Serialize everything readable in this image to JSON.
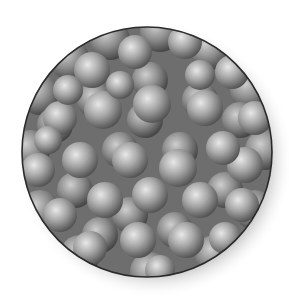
{
  "figure": {
    "circle": {
      "cx": 147,
      "cy": 152,
      "r": 125,
      "stroke": "#2a2a2a",
      "background": "#6e6e6e"
    },
    "colors": {
      "sphere_highlight": "#e6e6e6",
      "sphere_mid": "#a8a8a8",
      "sphere_shadow": "#4a4a4a",
      "shadow": "#bdbdbd"
    },
    "back_layer": [
      [
        40,
        95,
        20
      ],
      [
        70,
        60,
        20
      ],
      [
        110,
        40,
        20
      ],
      [
        160,
        32,
        20
      ],
      [
        210,
        50,
        20
      ],
      [
        250,
        90,
        20
      ],
      [
        30,
        150,
        20
      ],
      [
        265,
        150,
        20
      ],
      [
        40,
        210,
        20
      ],
      [
        255,
        210,
        20
      ],
      [
        80,
        255,
        20
      ],
      [
        150,
        272,
        20
      ],
      [
        215,
        255,
        20
      ],
      [
        95,
        100,
        18
      ],
      [
        150,
        80,
        18
      ],
      [
        200,
        100,
        18
      ],
      [
        120,
        150,
        18
      ],
      [
        180,
        150,
        18
      ],
      [
        75,
        190,
        18
      ],
      [
        225,
        190,
        18
      ],
      [
        130,
        215,
        18
      ],
      [
        175,
        230,
        18
      ],
      [
        100,
        235,
        18
      ],
      [
        240,
        120,
        18
      ],
      [
        55,
        125,
        18
      ],
      [
        145,
        120,
        18
      ]
    ],
    "front_layer": [
      [
        92,
        70,
        18
      ],
      [
        135,
        52,
        17
      ],
      [
        185,
        42,
        17
      ],
      [
        232,
        72,
        17
      ],
      [
        255,
        118,
        17
      ],
      [
        60,
        118,
        17
      ],
      [
        103,
        110,
        19
      ],
      [
        152,
        104,
        19
      ],
      [
        205,
        108,
        18
      ],
      [
        245,
        165,
        18
      ],
      [
        38,
        170,
        17
      ],
      [
        80,
        160,
        18
      ],
      [
        130,
        160,
        18
      ],
      [
        178,
        168,
        19
      ],
      [
        223,
        148,
        17
      ],
      [
        60,
        215,
        17
      ],
      [
        105,
        200,
        18
      ],
      [
        150,
        195,
        18
      ],
      [
        200,
        200,
        18
      ],
      [
        242,
        205,
        17
      ],
      [
        90,
        248,
        17
      ],
      [
        138,
        240,
        18
      ],
      [
        186,
        240,
        18
      ],
      [
        225,
        238,
        16
      ],
      [
        160,
        270,
        15
      ],
      [
        68,
        90,
        15
      ],
      [
        200,
        75,
        15
      ],
      [
        120,
        85,
        14
      ],
      [
        48,
        140,
        14
      ]
    ]
  }
}
